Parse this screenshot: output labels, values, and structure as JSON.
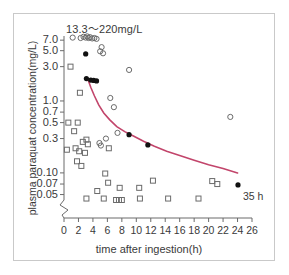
{
  "chart_data": {
    "type": "scatter",
    "title": "13.3〜220mg/L",
    "xlabel": "time after ingestion(h)",
    "ylabel": "plasma paraquat concentration(mg/L)",
    "yscale": "log",
    "xlim": [
      0,
      26
    ],
    "ylim": [
      0.05,
      8.0
    ],
    "grid": false,
    "legend": null,
    "xticks": [
      0,
      2,
      4,
      6,
      8,
      10,
      12,
      14,
      16,
      18,
      20,
      22,
      24,
      26
    ],
    "xtick_labels": [
      "0",
      "2",
      "4",
      "6",
      "8",
      "10",
      "12",
      "14",
      "16",
      "18",
      "20",
      "22",
      "24",
      "26"
    ],
    "yticks": [
      7.0,
      5.0,
      3.0,
      1.0,
      0.7,
      0.5,
      0.3,
      0.1,
      0.07,
      0.05
    ],
    "ytick_labels": [
      "7.0",
      "5.0",
      "3.0",
      "1.0",
      "0.7",
      "0.5",
      "0.3",
      "0.10",
      "0.07",
      "0.05"
    ],
    "axis_break": "y-axis break below 0.05",
    "annotations": [
      {
        "text": "35 h",
        "marker": "filled-circle",
        "x": 26.5,
        "y": 0.068
      }
    ],
    "series": [
      {
        "name": "survivors",
        "marker": "open-circle",
        "color": "#6b6b6b",
        "points": [
          [
            1.2,
            7.6
          ],
          [
            2.3,
            7.5
          ],
          [
            2.7,
            7.8
          ],
          [
            3.0,
            7.6
          ],
          [
            3.2,
            7.9
          ],
          [
            3.4,
            7.5
          ],
          [
            3.6,
            7.7
          ],
          [
            3.9,
            7.4
          ],
          [
            4.2,
            7.5
          ],
          [
            4.5,
            7.3
          ],
          [
            5.2,
            5.6
          ],
          [
            5.4,
            4.6
          ],
          [
            5.0,
            4.9
          ],
          [
            9.0,
            2.7
          ],
          [
            6.4,
            1.1
          ],
          [
            6.9,
            0.82
          ],
          [
            7.4,
            0.36
          ],
          [
            5.8,
            0.3
          ],
          [
            4.9,
            0.26
          ],
          [
            5.1,
            0.24
          ],
          [
            23.0,
            0.6
          ]
        ]
      },
      {
        "name": "non-survivors",
        "marker": "open-square",
        "color": "#6b6b6b",
        "points": [
          [
            0.9,
            3.0
          ],
          [
            2.2,
            1.3
          ],
          [
            0.6,
            0.5
          ],
          [
            1.9,
            0.5
          ],
          [
            1.4,
            0.38
          ],
          [
            0.4,
            0.21
          ],
          [
            1.6,
            0.22
          ],
          [
            2.6,
            0.27
          ],
          [
            3.1,
            0.29
          ],
          [
            3.3,
            0.25
          ],
          [
            2.1,
            0.2
          ],
          [
            2.9,
            0.19
          ],
          [
            6.2,
            0.22
          ],
          [
            1.8,
            0.145
          ],
          [
            2.4,
            0.125
          ],
          [
            5.7,
            0.098
          ],
          [
            6.1,
            0.073
          ],
          [
            4.6,
            0.056
          ],
          [
            7.7,
            0.062
          ],
          [
            10.4,
            0.062
          ],
          [
            12.3,
            0.078
          ],
          [
            20.5,
            0.077
          ],
          [
            21.2,
            0.07
          ],
          [
            3.1,
            0.044
          ],
          [
            5.5,
            0.044
          ],
          [
            7.2,
            0.042
          ],
          [
            7.6,
            0.042
          ],
          [
            8.0,
            0.042
          ],
          [
            10.5,
            0.044
          ],
          [
            14.4,
            0.044
          ],
          [
            18.6,
            0.044
          ]
        ]
      },
      {
        "name": "reference cases",
        "marker": "filled-circle",
        "color": "#111111",
        "points": [
          [
            3.0,
            4.5
          ],
          [
            3.1,
            2.05
          ],
          [
            3.7,
            1.95
          ],
          [
            4.1,
            1.93
          ],
          [
            4.5,
            1.9
          ],
          [
            9.0,
            0.34
          ],
          [
            11.6,
            0.245
          ]
        ]
      }
    ],
    "fit_curve": {
      "name": "regression curve",
      "color": "#c2456b",
      "points": [
        [
          3.3,
          2.0
        ],
        [
          3.7,
          1.55
        ],
        [
          4.2,
          1.18
        ],
        [
          4.8,
          0.88
        ],
        [
          5.5,
          0.68
        ],
        [
          6.3,
          0.55
        ],
        [
          7.3,
          0.44
        ],
        [
          8.4,
          0.375
        ],
        [
          9.6,
          0.325
        ],
        [
          11.0,
          0.275
        ],
        [
          12.5,
          0.235
        ],
        [
          14.2,
          0.2
        ],
        [
          16.0,
          0.175
        ],
        [
          18.0,
          0.15
        ],
        [
          20.0,
          0.13
        ],
        [
          22.0,
          0.115
        ],
        [
          24.0,
          0.1
        ]
      ]
    }
  }
}
